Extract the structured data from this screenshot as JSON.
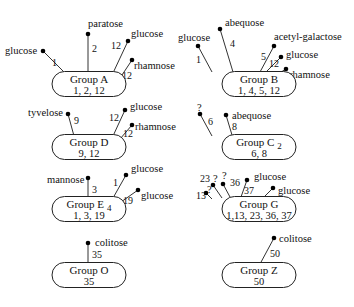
{
  "diagram": {
    "groups": [
      {
        "id": "A",
        "title": "Group A",
        "subscript": "",
        "factors": "1, 2, 12",
        "cx": 89,
        "cy": 84,
        "sugars": [
          {
            "name": "glucose",
            "num": "1",
            "base": [
              65,
              73
            ],
            "tip": [
              43,
              51
            ],
            "label_pos": [
              5,
              54
            ],
            "num_pos": [
              52,
              66
            ]
          },
          {
            "name": "paratose",
            "num": "2",
            "base": [
              88,
              72
            ],
            "tip": [
              88,
              34
            ],
            "label_pos": [
              88,
              27
            ],
            "num_pos": [
              92,
              52
            ]
          },
          {
            "name": "glucose",
            "num": "12",
            "base": [
              113,
              73
            ],
            "tip": [
              128,
              41
            ],
            "label_pos": [
              131,
              37
            ],
            "num_pos": [
              111,
              49
            ]
          },
          {
            "name": "rhamnose",
            "num": "12",
            "base": [
              120,
              78
            ],
            "tip": [
              132,
              60
            ],
            "label_pos": [
              134,
              69
            ],
            "num_pos": [
              122,
              79
            ]
          }
        ]
      },
      {
        "id": "B",
        "title": "Group B",
        "subscript": "",
        "factors": "1, 4, 5, 12",
        "cx": 259,
        "cy": 84,
        "sugars": [
          {
            "name": "glucose",
            "num": "1",
            "base": [
              212,
              72
            ],
            "tip": [
              198,
              46
            ],
            "label_pos": [
              178,
              41
            ],
            "num_pos": [
              196,
              63
            ]
          },
          {
            "name": "abequose",
            "num": "4",
            "base": [
              233,
              72
            ],
            "tip": [
              220,
              29
            ],
            "label_pos": [
              225,
              26
            ],
            "num_pos": [
              230,
              47
            ]
          },
          {
            "name": "acetyl-galactose",
            "num": "5",
            "base": [
              260,
              72
            ],
            "tip": [
              274,
              46
            ],
            "label_pos": [
              274,
              40
            ],
            "num_pos": [
              261,
              60
            ]
          },
          {
            "name": "glucose",
            "num": "12",
            "base": [
              264,
              74
            ],
            "tip": [
              281,
              57
            ],
            "label_pos": [
              286,
              58
            ],
            "num_pos": [
              269,
              67
            ]
          },
          {
            "name": "rhamnose",
            "num": "12",
            "base": [
              270,
              79
            ],
            "tip": [
              286,
              69
            ],
            "label_pos": [
              289,
              78
            ],
            "num_pos": [
              277,
              83
            ]
          }
        ]
      },
      {
        "id": "D",
        "title": "Group D",
        "subscript": "",
        "factors": "9, 12",
        "cx": 89,
        "cy": 147,
        "sugars": [
          {
            "name": "tyvelose",
            "num": "9",
            "base": [
              74,
              136
            ],
            "tip": [
              68,
              114
            ],
            "label_pos": [
              28,
              116
            ],
            "num_pos": [
              74,
              124
            ]
          },
          {
            "name": "glucose",
            "num": "12",
            "base": [
              113,
              136
            ],
            "tip": [
              125,
              110
            ],
            "label_pos": [
              130,
              110
            ],
            "num_pos": [
              109,
              121
            ]
          },
          {
            "name": "rhamnose",
            "num": "12",
            "base": [
              120,
              139
            ],
            "tip": [
              132,
              125
            ],
            "label_pos": [
              135,
              130
            ],
            "num_pos": [
              123,
              137
            ]
          }
        ]
      },
      {
        "id": "C2",
        "title": "Group C",
        "subscript": "2",
        "factors": "6, 8",
        "cx": 259,
        "cy": 147,
        "sugars": [
          {
            "name": "?",
            "num": "6",
            "base": [
              212,
              136
            ],
            "tip": [
              200,
              114
            ],
            "label_pos": [
              197,
              111
            ],
            "num_pos": [
              208,
              125
            ]
          },
          {
            "name": "abequose",
            "num": "8",
            "base": [
              232,
              135
            ],
            "tip": [
              226,
              115
            ],
            "label_pos": [
              232,
              119
            ],
            "num_pos": [
              232,
              130
            ]
          }
        ]
      },
      {
        "id": "E4",
        "title": "Group E",
        "subscript": "4",
        "factors": "1, 3, 19",
        "cx": 89,
        "cy": 209,
        "sugars": [
          {
            "name": "mannose",
            "num": "3",
            "base": [
              88,
              198
            ],
            "tip": [
              88,
              178
            ],
            "label_pos": [
              47,
              183
            ],
            "num_pos": [
              92,
              193
            ]
          },
          {
            "name": "glucose",
            "num": "1",
            "base": [
              113,
              198
            ],
            "tip": [
              126,
              175
            ],
            "label_pos": [
              131,
              172
            ],
            "num_pos": [
              113,
              186
            ]
          },
          {
            "name": "glucose",
            "num": "19",
            "base": [
              121,
              202
            ],
            "tip": [
              138,
              190
            ],
            "label_pos": [
              141,
              199
            ],
            "num_pos": [
              123,
              204
            ]
          }
        ]
      },
      {
        "id": "G",
        "title": "Group G",
        "subscript": "",
        "factors": "1,13, 23, 36, 37",
        "cx": 259,
        "cy": 209,
        "sugars": [
          {
            "name": "?",
            "num": "13",
            "base": [
              212,
              199
            ],
            "tip": [
              206,
              193
            ],
            "label_pos": [
              207,
              193
            ],
            "num_pos": [
              196,
              199
            ]
          },
          {
            "name": "?",
            "num": "23",
            "base": [
              222,
              198
            ],
            "tip": [
              213,
              185
            ],
            "label_pos": [
              213,
              182
            ],
            "num_pos": [
              200,
              182
            ]
          },
          {
            "name": "?",
            "num": "36",
            "base": [
              230,
              197
            ],
            "tip": [
              223,
              184
            ],
            "label_pos": [
              222,
              179
            ],
            "num_pos": [
              230,
              186
            ]
          },
          {
            "name": "glucose",
            "num": "37",
            "base": [
              241,
              197
            ],
            "tip": [
              247,
              180
            ],
            "label_pos": [
              254,
              180
            ],
            "num_pos": [
              244,
              194
            ]
          },
          {
            "name": "glucose",
            "num": "1",
            "base": [
              262,
              199
            ],
            "tip": [
              273,
              188
            ],
            "label_pos": [
              278,
              194
            ],
            "num_pos": [
              263,
              203
            ]
          }
        ]
      },
      {
        "id": "O",
        "title": "Group O",
        "subscript": "",
        "factors": "35",
        "cx": 89,
        "cy": 275,
        "sugars": [
          {
            "name": "colitose",
            "num": "35",
            "base": [
              88,
              264
            ],
            "tip": [
              88,
              243
            ],
            "label_pos": [
              95,
              246
            ],
            "num_pos": [
              92,
              258
            ]
          }
        ]
      },
      {
        "id": "Z",
        "title": "Group Z",
        "subscript": "",
        "factors": "50",
        "cx": 259,
        "cy": 275,
        "sugars": [
          {
            "name": "colitose",
            "num": "50",
            "base": [
              260,
              264
            ],
            "tip": [
              274,
              238
            ],
            "label_pos": [
              279,
              242
            ],
            "num_pos": [
              270,
              257
            ]
          }
        ]
      }
    ]
  }
}
